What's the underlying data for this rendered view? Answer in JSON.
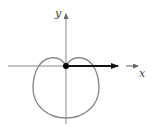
{
  "diagram": {
    "type": "polar-curve",
    "axes": {
      "x_label": "x",
      "y_label": "y"
    },
    "curve": {
      "shape": "limacon-dimpled",
      "color": "#8a8a8a"
    },
    "vector": {
      "description": "polar axis ray from origin",
      "color": "#111111"
    },
    "origin_point_color": "#000000",
    "axis_color": "#8a8a8a"
  }
}
